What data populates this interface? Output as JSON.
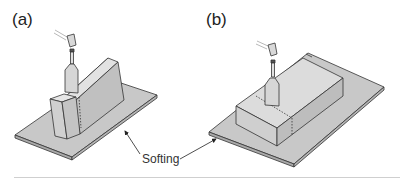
{
  "figure": {
    "panels": [
      {
        "id": "a",
        "label": "(a)"
      },
      {
        "id": "b",
        "label": "(b)"
      }
    ],
    "annotation": {
      "text": "Softing"
    },
    "colors": {
      "fill_light": "#d9d9d9",
      "fill_mid": "#c6c6c6",
      "fill_dark": "#b0b0b0",
      "stroke": "#333333"
    }
  }
}
